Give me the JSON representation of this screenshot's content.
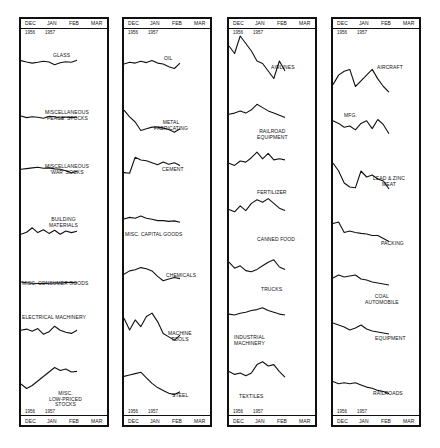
{
  "axis": {
    "months": [
      "DEC",
      "JAN",
      "FEB",
      "MAR"
    ],
    "years": [
      "1956",
      "1957"
    ]
  },
  "chart_data": {
    "type": "line",
    "title": "",
    "layout": "small multiples, 4 columns, 7 series each, no y-axis",
    "x_range": [
      "DEC 1956",
      "MAR 1957"
    ],
    "x_ticks": [
      "DEC",
      "JAN",
      "FEB",
      "MAR"
    ],
    "year_labels": [
      "1956",
      "1957"
    ],
    "note": "values are relative index shapes (0-100) read visually; x is weekly from early Dec 1956 to mid Feb 1957 (11 points)",
    "x": [
      0,
      1,
      2,
      3,
      4,
      5,
      6,
      7,
      8,
      9,
      10
    ],
    "columns": [
      {
        "series": [
          {
            "name": "GLASS",
            "values": [
              60,
              50,
              42,
              48,
              55,
              50,
              30,
              45,
              52,
              48,
              62
            ]
          },
          {
            "name": "MISCELLANEOUS 'PEACE' STOCKS",
            "values": [
              58,
              45,
              52,
              48,
              40,
              55,
              52,
              42,
              50,
              45,
              48
            ]
          },
          {
            "name": "MISCELLANEOUS 'WAR' SOCKS",
            "values": [
              55,
              60,
              65,
              70,
              62,
              65,
              58,
              55,
              45,
              30,
              40
            ]
          },
          {
            "name": "BUILDING MATERIALS",
            "values": [
              30,
              42,
              70,
              40,
              58,
              35,
              55,
              30,
              50,
              40,
              48
            ]
          },
          {
            "name": "MISC. CONSUMER GOODS",
            "values": [
              60,
              52,
              48,
              45,
              46,
              48,
              52,
              50,
              55,
              58,
              50
            ]
          },
          {
            "name": "ELECTRICAL MACHINERY",
            "values": [
              55,
              62,
              48,
              65,
              30,
              45,
              80,
              55,
              42,
              35,
              55
            ]
          },
          {
            "name": "MISC. LOW-PRICED STOCKS",
            "values": [
              30,
              15,
              25,
              40,
              55,
              70,
              85,
              75,
              80,
              70,
              72
            ]
          }
        ]
      },
      {
        "series": [
          {
            "name": "OIL",
            "values": [
              50,
              60,
              55,
              65,
              58,
              70,
              55,
              50,
              35,
              25,
              55
            ]
          },
          {
            "name": "METAL FABRICATING",
            "values": [
              85,
              65,
              50,
              25,
              30,
              35,
              35,
              32,
              28,
              20,
              30
            ]
          },
          {
            "name": "CEMENT",
            "values": [
              30,
              28,
              85,
              75,
              72,
              65,
              58,
              68,
              60,
              65,
              55
            ]
          },
          {
            "name": "MISC. CAPITAL GOODS",
            "values": [
              50,
              60,
              55,
              68,
              55,
              48,
              40,
              40,
              35,
              38,
              30
            ]
          },
          {
            "name": "CHEMICALS",
            "values": [
              40,
              55,
              60,
              70,
              65,
              55,
              30,
              10,
              18,
              25,
              20
            ]
          },
          {
            "name": "MACHINE TOOLS",
            "values": [
              70,
              35,
              65,
              45,
              75,
              85,
              60,
              25,
              15,
              5,
              20
            ]
          },
          {
            "name": "STEEL",
            "values": [
              70,
              75,
              80,
              85,
              65,
              45,
              30,
              20,
              10,
              5,
              15
            ]
          }
        ]
      },
      {
        "series": [
          {
            "name": "AIRLINES",
            "values": [
              70,
              55,
              90,
              75,
              60,
              40,
              35,
              20,
              5,
              40,
              20
            ]
          },
          {
            "name": "RAILROAD EQUIPMENT",
            "values": [
              40,
              45,
              55,
              45,
              60,
              85,
              70,
              55,
              45,
              35,
              25
            ]
          },
          {
            "name": "FERTILIZER",
            "values": [
              40,
              30,
              50,
              45,
              65,
              90,
              60,
              85,
              55,
              60,
              55
            ]
          },
          {
            "name": "CANNED FOOD",
            "values": [
              40,
              30,
              55,
              35,
              65,
              80,
              70,
              85,
              65,
              45,
              35
            ]
          },
          {
            "name": "TRUCKS",
            "values": [
              70,
              45,
              55,
              35,
              30,
              40,
              55,
              70,
              80,
              50,
              40
            ]
          },
          {
            "name": "INDUSTRIAL MACHINERY",
            "values": [
              55,
              50,
              60,
              65,
              75,
              80,
              90,
              75,
              65,
              55,
              50
            ]
          },
          {
            "name": "TEXTILES",
            "values": [
              55,
              45,
              50,
              40,
              50,
              80,
              90,
              75,
              80,
              55,
              35
            ]
          }
        ]
      },
      {
        "series": [
          {
            "name": "AIRCRAFT MFG.",
            "values": [
              30,
              55,
              65,
              70,
              25,
              40,
              55,
              70,
              45,
              25,
              10
            ]
          },
          {
            "name": "LEAD & ZINC",
            "values": [
              70,
              60,
              45,
              50,
              35,
              60,
              70,
              40,
              75,
              55,
              20
            ]
          },
          {
            "name": "MEAT PACKING",
            "values": [
              90,
              70,
              40,
              30,
              28,
              70,
              55,
              60,
              50,
              45,
              25
            ]
          },
          {
            "name": "COAL",
            "values": [
              75,
              80,
              45,
              50,
              45,
              42,
              40,
              35,
              35,
              25,
              15
            ]
          },
          {
            "name": "AUTOMOBILE EQUIPMENT",
            "values": [
              50,
              65,
              55,
              60,
              65,
              45,
              40,
              30,
              25,
              20,
              15
            ]
          },
          {
            "name": "RAILROADS",
            "values": [
              75,
              65,
              55,
              40,
              50,
              65,
              45,
              35,
              30,
              25,
              20
            ]
          },
          {
            "name": "COPPER",
            "values": [
              70,
              60,
              65,
              60,
              65,
              55,
              45,
              40,
              30,
              25,
              15
            ]
          }
        ]
      }
    ]
  },
  "labels": {
    "c0": [
      "GLASS",
      "MISCELLANEOUS",
      "'PEACE' STOCKS",
      "MISCELLANEOUS",
      "'WAR' SOCKS",
      "BUILDING",
      "MATERIALS",
      "MISC. CONSUMER GOODS",
      "ELECTRICAL MACHINERY",
      "MISC.",
      "LOW-PRICED",
      "STOCKS"
    ],
    "c1": [
      "OIL",
      "METAL",
      "FABRICATING",
      "CEMENT",
      "MISC. CAPITAL GOODS",
      "CHEMICALS",
      "MACHINE",
      "TOOLS",
      "STEEL"
    ],
    "c2": [
      "AIRLINES",
      "RAILROAD",
      "EQUIPMENT",
      "FERTILIZER",
      "CANNED FOOD",
      "TRUCKS",
      "INDUSTRIAL",
      "MACHINERY",
      "TEXTILES"
    ],
    "c3": [
      "AIRCRAFT",
      "MFG.",
      "LEAD & ZINC",
      "MEAT",
      "PACKING",
      "COAL",
      "AUTOMOBILE",
      "EQUIPMENT",
      "RAILROADS",
      "COPPER"
    ]
  },
  "colors": {
    "line": "#111111",
    "border": "#111111",
    "background": "#ffffff"
  }
}
